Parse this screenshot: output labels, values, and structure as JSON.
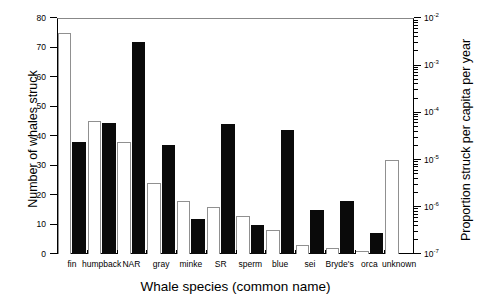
{
  "chart_data": {
    "type": "bar",
    "title": "",
    "xlabel": "Whale species (common name)",
    "ylabel": "Number of whales struck",
    "ylabel_right": "Proportion struck per capita per year",
    "categories": [
      "fin",
      "humpback",
      "NAR",
      "gray",
      "minke",
      "SR",
      "sperm",
      "blue",
      "sei",
      "Bryde's",
      "orca",
      "unknown"
    ],
    "series": [
      {
        "name": "open",
        "style": "open-bar",
        "values": [
          75,
          45,
          38,
          24,
          18,
          16,
          13,
          8,
          3,
          2,
          1,
          32
        ]
      },
      {
        "name": "filled",
        "style": "filled-bar",
        "values": [
          38,
          44.5,
          72,
          37,
          12,
          44,
          10,
          42,
          15,
          18,
          7,
          null
        ]
      }
    ],
    "ylim": [
      0,
      80
    ],
    "yticks": [
      0,
      10,
      20,
      30,
      40,
      50,
      60,
      70,
      80
    ],
    "ytick_labels": [
      "0",
      "10",
      "20",
      "30",
      "40",
      "50",
      "60",
      "70",
      "80"
    ],
    "right_axis": {
      "scale": "log",
      "ylim": [
        "1e-7",
        "1e-2"
      ],
      "ticks": [
        "1e-7",
        "1e-6",
        "1e-5",
        "1e-4",
        "1e-3",
        "1e-2"
      ],
      "tick_labels": [
        "10-7",
        "10-6",
        "10-5",
        "10-4",
        "10-3",
        "10-2"
      ],
      "tick_mantissa": "10",
      "tick_exponents": [
        "-7",
        "-6",
        "-5",
        "-4",
        "-3",
        "-2"
      ],
      "minor_ticks": true
    },
    "grid": false,
    "legend": null,
    "colors": {
      "open_bar_fill": "#ffffff",
      "open_bar_edge": "#909090",
      "filled_bar_fill": "#0a0a0a",
      "axis": "#000000",
      "background": "#ffffff"
    }
  }
}
